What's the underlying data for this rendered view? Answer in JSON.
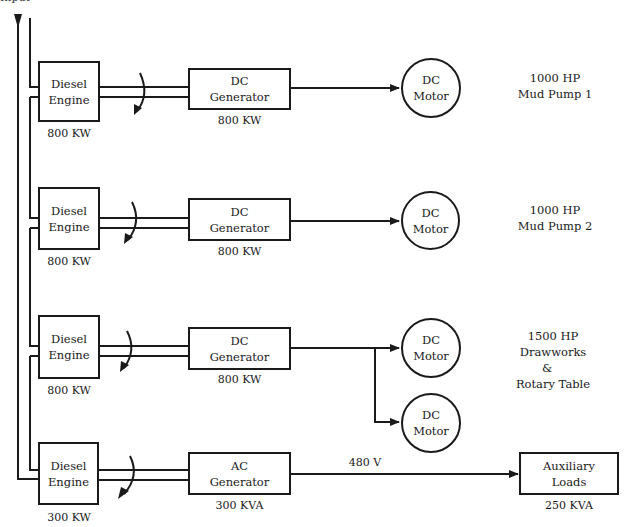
{
  "header": {
    "cropped_label": "Input"
  },
  "rows": [
    {
      "engine": {
        "line1": "Diesel",
        "line2": "Engine",
        "rating": "800 KW"
      },
      "generator": {
        "line1": "DC",
        "line2": "Generator",
        "rating": "800 KW"
      },
      "motors": [
        {
          "line1": "DC",
          "line2": "Motor"
        }
      ],
      "load": {
        "line1": "1000 HP",
        "line2": "Mud Pump 1"
      }
    },
    {
      "engine": {
        "line1": "Diesel",
        "line2": "Engine",
        "rating": "800 KW"
      },
      "generator": {
        "line1": "DC",
        "line2": "Generator",
        "rating": "800 KW"
      },
      "motors": [
        {
          "line1": "DC",
          "line2": "Motor"
        }
      ],
      "load": {
        "line1": "1000 HP",
        "line2": "Mud Pump 2"
      }
    },
    {
      "engine": {
        "line1": "Diesel",
        "line2": "Engine",
        "rating": "800 KW"
      },
      "generator": {
        "line1": "DC",
        "line2": "Generator",
        "rating": "800 KW"
      },
      "motors": [
        {
          "line1": "DC",
          "line2": "Motor"
        },
        {
          "line1": "DC",
          "line2": "Motor"
        }
      ],
      "load": {
        "line1": "1500 HP",
        "line2": "Drawworks",
        "line3": "&",
        "line4": "Rotary Table"
      }
    },
    {
      "engine": {
        "line1": "Diesel",
        "line2": "Engine",
        "rating": "300 KW"
      },
      "generator": {
        "line1": "AC",
        "line2": "Generator",
        "rating": "300 KVA"
      },
      "voltage": "480 V",
      "aux": {
        "line1": "Auxiliary",
        "line2": "Loads",
        "rating": "250 KVA"
      }
    }
  ],
  "colors": {
    "ink": "#1a1a1a",
    "background": "#ffffff"
  }
}
